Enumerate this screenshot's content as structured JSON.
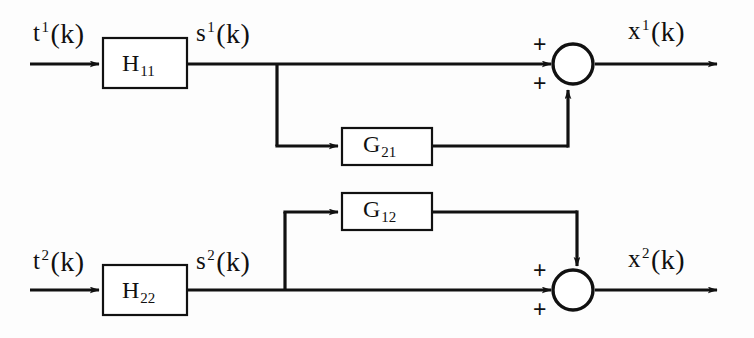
{
  "diagram": {
    "stroke_color": "#111111",
    "background_color": "#fdfdfd",
    "signals": {
      "input_1": {
        "base": "t",
        "sup": "1",
        "arg": "(k)"
      },
      "input_2": {
        "base": "t",
        "sup": "2",
        "arg": "(k)"
      },
      "mid_1": {
        "base": "s",
        "sup": "1",
        "arg": "(k)"
      },
      "mid_2": {
        "base": "s",
        "sup": "2",
        "arg": "(k)"
      },
      "output_1": {
        "base": "x",
        "sup": "1",
        "arg": "(k)"
      },
      "output_2": {
        "base": "x",
        "sup": "2",
        "arg": "(k)"
      }
    },
    "blocks": [
      {
        "id": "h11",
        "base": "H",
        "sub": "11"
      },
      {
        "id": "g21",
        "base": "G",
        "sub": "21"
      },
      {
        "id": "g12",
        "base": "G",
        "sub": "12"
      },
      {
        "id": "h22",
        "base": "H",
        "sub": "22"
      }
    ],
    "summing_junctions": [
      {
        "id": "sum1",
        "signs": [
          "+",
          "+"
        ]
      },
      {
        "id": "sum2",
        "signs": [
          "+",
          "+"
        ]
      }
    ]
  }
}
